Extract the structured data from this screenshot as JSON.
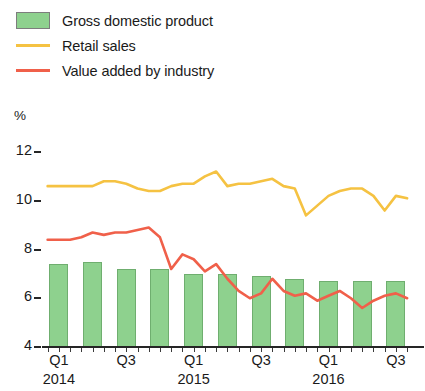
{
  "legend": {
    "items": [
      {
        "label": "Gross domestic product",
        "marker": "swatch",
        "color": "#8ed18e"
      },
      {
        "label": "Retail sales",
        "marker": "line",
        "color": "#f5c242"
      },
      {
        "label": "Value added by industry",
        "marker": "line",
        "color": "#f0604a"
      }
    ]
  },
  "axis": {
    "unit": "%",
    "yticks": [
      "12",
      "10",
      "8",
      "6",
      "4"
    ],
    "xticks": [
      "Q1",
      "Q3",
      "Q1",
      "Q3",
      "Q1",
      "Q3"
    ],
    "xyears": [
      "2014",
      "2015",
      "2016"
    ]
  },
  "chart_data": {
    "type": "bar",
    "title": "",
    "xlabel": "",
    "ylabel": "%",
    "ylim": [
      4,
      12
    ],
    "grid": false,
    "legend_position": "top-left",
    "categories": [
      "Q1 2014",
      "Q2 2014",
      "Q3 2014",
      "Q4 2014",
      "Q1 2015",
      "Q2 2015",
      "Q3 2015",
      "Q4 2015",
      "Q1 2016",
      "Q2 2016",
      "Q3 2016"
    ],
    "series": [
      {
        "name": "Gross domestic product",
        "type": "bar",
        "color": "#8ed18e",
        "values": [
          7.4,
          7.5,
          7.2,
          7.2,
          7.0,
          7.0,
          6.9,
          6.8,
          6.7,
          6.7,
          6.7
        ]
      },
      {
        "name": "Retail sales",
        "type": "line",
        "color": "#f5c242",
        "x": [
          "2014-01",
          "2014-02",
          "2014-03",
          "2014-04",
          "2014-05",
          "2014-06",
          "2014-07",
          "2014-08",
          "2014-09",
          "2014-10",
          "2014-11",
          "2014-12",
          "2015-01",
          "2015-02",
          "2015-03",
          "2015-04",
          "2015-05",
          "2015-06",
          "2015-07",
          "2015-08",
          "2015-09",
          "2015-10",
          "2015-11",
          "2015-12",
          "2016-01",
          "2016-02",
          "2016-03",
          "2016-04",
          "2016-05",
          "2016-06",
          "2016-07",
          "2016-08",
          "2016-09"
        ],
        "values": [
          10.6,
          10.6,
          10.6,
          10.6,
          10.6,
          10.8,
          10.8,
          10.7,
          10.5,
          10.4,
          10.4,
          10.6,
          10.7,
          10.7,
          11.0,
          11.2,
          10.6,
          10.7,
          10.7,
          10.8,
          10.9,
          10.6,
          10.5,
          9.4,
          9.8,
          10.2,
          10.4,
          10.5,
          10.5,
          10.2,
          9.6,
          10.2,
          10.1
        ]
      },
      {
        "name": "Value added by industry",
        "type": "line",
        "color": "#f0604a",
        "x": [
          "2014-01",
          "2014-02",
          "2014-03",
          "2014-04",
          "2014-05",
          "2014-06",
          "2014-07",
          "2014-08",
          "2014-09",
          "2014-10",
          "2014-11",
          "2014-12",
          "2015-01",
          "2015-02",
          "2015-03",
          "2015-04",
          "2015-05",
          "2015-06",
          "2015-07",
          "2015-08",
          "2015-09",
          "2015-10",
          "2015-11",
          "2015-12",
          "2016-01",
          "2016-02",
          "2016-03",
          "2016-04",
          "2016-05",
          "2016-06",
          "2016-07",
          "2016-08",
          "2016-09"
        ],
        "values": [
          8.4,
          8.4,
          8.4,
          8.5,
          8.7,
          8.6,
          8.7,
          8.7,
          8.8,
          8.9,
          8.5,
          7.2,
          7.8,
          7.6,
          7.1,
          7.4,
          6.8,
          6.3,
          6.0,
          6.2,
          6.8,
          6.3,
          6.1,
          6.2,
          5.9,
          6.1,
          6.3,
          6.0,
          5.6,
          5.9,
          6.1,
          6.2,
          6.0
        ]
      }
    ]
  }
}
